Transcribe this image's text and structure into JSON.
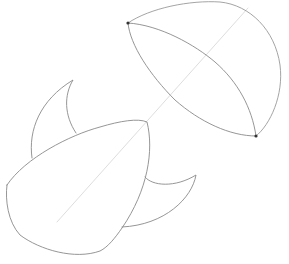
{
  "image": {
    "kind": "pencil-sketch",
    "subject": "construction sketch of two overlapping shapes (dome/umbrella cap and teardrop body with fins)",
    "background": "#ffffff",
    "stroke_color": "#8a8a8a",
    "guide_color": "#cfcfcf",
    "dot_color": "#333333"
  },
  "shapes": {
    "dome": {
      "endpoints": [
        [
          128,
          23
        ],
        [
          256,
          136
        ]
      ]
    },
    "axis_line": {
      "from": [
        248,
        8
      ],
      "to": [
        57,
        222
      ]
    },
    "body": {},
    "upper_fin": {},
    "lower_fin": {}
  }
}
